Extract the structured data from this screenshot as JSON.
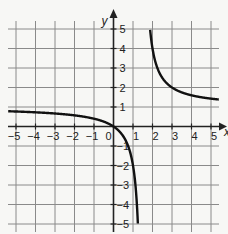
{
  "chart_data": {
    "type": "line",
    "title": "",
    "xlabel": "x",
    "ylabel": "y",
    "xlim": [
      -5,
      5
    ],
    "ylim": [
      -5,
      5
    ],
    "grid": true,
    "x_ticks": [
      "−5",
      "−4",
      "−3",
      "−2",
      "−1",
      "0",
      "1",
      "2",
      "3",
      "4",
      "5"
    ],
    "y_ticks_pos": [
      "1",
      "2",
      "3",
      "4",
      "5"
    ],
    "y_ticks_neg": [
      "−1",
      "−2",
      "−3",
      "−4",
      "−5"
    ],
    "origin_label": "0",
    "series": [
      {
        "name": "left branch",
        "x": [
          -5,
          -4,
          -3,
          -2,
          -1,
          0,
          0.5,
          1,
          1.25,
          1.4,
          1.45
        ],
        "y": [
          0.77,
          0.73,
          0.67,
          0.57,
          0.4,
          0,
          -0.5,
          -2,
          -5,
          -14,
          -29
        ]
      },
      {
        "name": "right branch",
        "x": [
          1.8,
          2,
          2.5,
          3,
          3.5,
          4,
          4.5,
          5
        ],
        "y": [
          6,
          4,
          2.5,
          2,
          1.75,
          1.6,
          1.5,
          1.43
        ]
      }
    ],
    "asymptotes": {
      "vertical": 1.5,
      "horizontal": 1
    },
    "colors": {
      "grid": "#8a8a8a",
      "axis": "#222222",
      "curve": "#111111"
    }
  }
}
